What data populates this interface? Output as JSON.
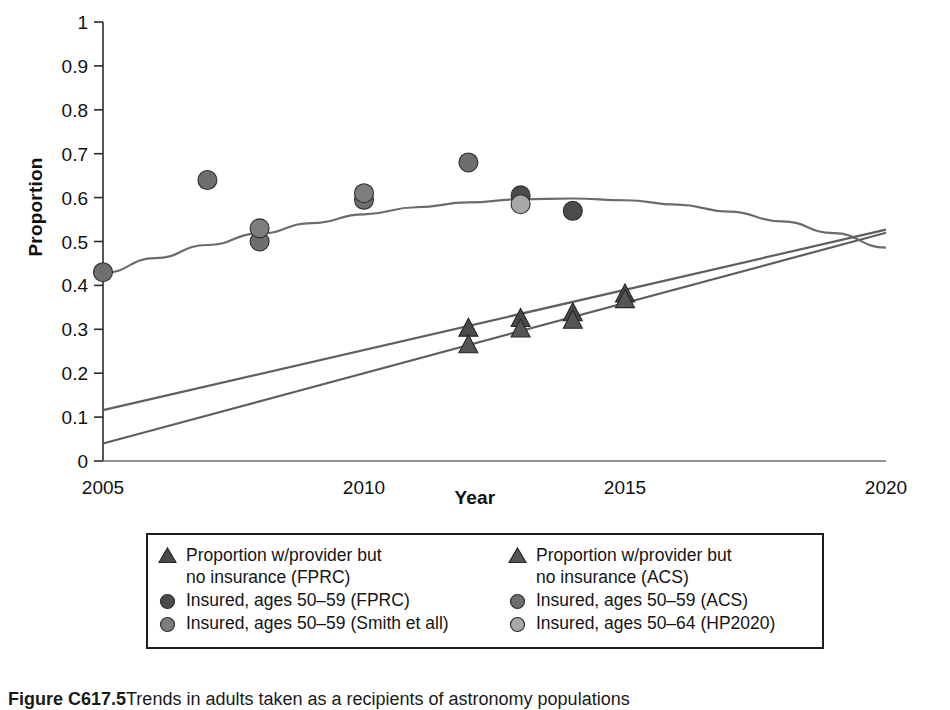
{
  "figure": {
    "caption_label": "Figure C617.5",
    "caption_text": "Trends in adults taken as a recipients of astronomy populations"
  },
  "axes": {
    "xlabel": "Year",
    "ylabel": "Proportion",
    "x_ticks": [
      "2005",
      "2010",
      "2015",
      "2020"
    ],
    "y_ticks": [
      "0",
      "0.1",
      "0.2",
      "0.3",
      "0.4",
      "0.5",
      "0.6",
      "0.7",
      "0.8",
      "0.9",
      "1"
    ]
  },
  "legend": {
    "entries": [
      {
        "label": "Proportion w/provider but\nno insurance (FPRC)",
        "marker": "triangle",
        "color": "#4a4a4a",
        "column": 0,
        "row": 0
      },
      {
        "label": "Proportion w/provider but\nno insurance (ACS)",
        "marker": "triangle",
        "color": "#555555",
        "column": 1,
        "row": 0
      },
      {
        "label": "Insured, ages 50–59 (FPRC)",
        "marker": "circle",
        "color": "#4b4b4b",
        "column": 0,
        "row": 1
      },
      {
        "label": "Insured, ages 50–59 (ACS)",
        "marker": "circle",
        "color": "#6e6e6e",
        "column": 1,
        "row": 1
      },
      {
        "label": "Insured, ages 50–59 (Smith et all)",
        "marker": "circle",
        "color": "#7d7d7d",
        "column": 0,
        "row": 2
      },
      {
        "label": "Insured, ages 50–64 (HP2020)",
        "marker": "circle",
        "color": "#a8a8a8",
        "column": 1,
        "row": 2
      }
    ]
  },
  "chart_data": {
    "type": "scatter",
    "title": "",
    "xlabel": "Year",
    "ylabel": "Proportion",
    "xlim": [
      2005,
      2020
    ],
    "ylim": [
      0,
      1
    ],
    "grid": false,
    "legend_position": "below-plot",
    "series": [
      {
        "name": "Insured, ages 50–59 (FPRC)",
        "marker": "circle",
        "color": "#4b4b4b",
        "points": [
          {
            "x": 2013,
            "y": 0.605
          },
          {
            "x": 2014,
            "y": 0.57
          }
        ]
      },
      {
        "name": "Insured, ages 50–59 (ACS)",
        "marker": "circle",
        "color": "#6e6e6e",
        "points": [
          {
            "x": 2005,
            "y": 0.43
          },
          {
            "x": 2007,
            "y": 0.64
          },
          {
            "x": 2008,
            "y": 0.5
          },
          {
            "x": 2010,
            "y": 0.595
          },
          {
            "x": 2012,
            "y": 0.68
          }
        ]
      },
      {
        "name": "Insured, ages 50–59 (Smith et all)",
        "marker": "circle",
        "color": "#7d7d7d",
        "points": [
          {
            "x": 2008,
            "y": 0.53
          },
          {
            "x": 2010,
            "y": 0.61
          }
        ]
      },
      {
        "name": "Insured, ages 50–64 (HP2020)",
        "marker": "circle",
        "color": "#a8a8a8",
        "points": [
          {
            "x": 2013,
            "y": 0.585
          }
        ]
      },
      {
        "name": "Proportion w/provider but no insurance (FPRC)",
        "marker": "triangle",
        "color": "#4a4a4a",
        "points": [
          {
            "x": 2012,
            "y": 0.3
          },
          {
            "x": 2013,
            "y": 0.322
          },
          {
            "x": 2014,
            "y": 0.335
          },
          {
            "x": 2015,
            "y": 0.378
          }
        ]
      },
      {
        "name": "Proportion w/provider but no insurance (ACS)",
        "marker": "triangle",
        "color": "#555555",
        "points": [
          {
            "x": 2012,
            "y": 0.262
          },
          {
            "x": 2013,
            "y": 0.298
          },
          {
            "x": 2014,
            "y": 0.318
          },
          {
            "x": 2015,
            "y": 0.365
          }
        ]
      }
    ],
    "trend_lines": [
      {
        "name": "Insured quadratic trend",
        "color": "#6b6b6b",
        "type": "quadratic",
        "points": [
          {
            "x": 2005,
            "y": 0.428
          },
          {
            "x": 2006,
            "y": 0.462
          },
          {
            "x": 2007,
            "y": 0.492
          },
          {
            "x": 2008,
            "y": 0.518
          },
          {
            "x": 2009,
            "y": 0.542
          },
          {
            "x": 2010,
            "y": 0.562
          },
          {
            "x": 2011,
            "y": 0.578
          },
          {
            "x": 2012,
            "y": 0.589
          },
          {
            "x": 2013,
            "y": 0.596
          },
          {
            "x": 2014,
            "y": 0.598
          },
          {
            "x": 2015,
            "y": 0.594
          },
          {
            "x": 2016,
            "y": 0.584
          },
          {
            "x": 2017,
            "y": 0.568
          },
          {
            "x": 2018,
            "y": 0.546
          },
          {
            "x": 2019,
            "y": 0.519
          },
          {
            "x": 2020,
            "y": 0.486
          }
        ]
      },
      {
        "name": "Provider-no-insurance trend upper",
        "color": "#5f5f5f",
        "type": "linear",
        "points": [
          {
            "x": 2005,
            "y": 0.116
          },
          {
            "x": 2020,
            "y": 0.527
          }
        ]
      },
      {
        "name": "Provider-no-insurance trend lower",
        "color": "#5f5f5f",
        "type": "linear",
        "points": [
          {
            "x": 2005,
            "y": 0.04
          },
          {
            "x": 2020,
            "y": 0.52
          }
        ]
      }
    ]
  }
}
